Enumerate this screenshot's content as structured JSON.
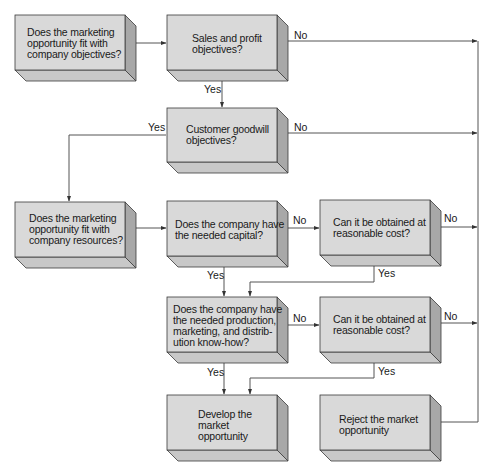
{
  "diagram": {
    "type": "flowchart",
    "colors": {
      "front": "#d9d9d9",
      "bottom": "#c8c8c8",
      "side": "#a8a8a8",
      "edge": "#3a3a3a",
      "line": "#555555"
    },
    "boxes": [
      {
        "id": "fit-objectives",
        "lines": [
          "Does the marketing",
          "opportunity fit with",
          "company objectives?"
        ]
      },
      {
        "id": "sales-profit",
        "lines": [
          "Sales and profit",
          "objectives?"
        ]
      },
      {
        "id": "customer-goodwill",
        "lines": [
          "Customer goodwill",
          "objectives?"
        ]
      },
      {
        "id": "fit-resources",
        "lines": [
          "Does the marketing",
          "opportunity fit with",
          "company resources?"
        ]
      },
      {
        "id": "needed-capital",
        "lines": [
          "Does the company have",
          "the needed capital?"
        ]
      },
      {
        "id": "obtain-capital",
        "lines": [
          "Can it be obtained at",
          "reasonable cost?"
        ]
      },
      {
        "id": "needed-knowhow",
        "lines": [
          "Does the company have",
          "the needed production,",
          "marketing, and distrib-",
          "ution know-how?"
        ]
      },
      {
        "id": "obtain-knowhow",
        "lines": [
          "Can it be obtained at",
          "reasonable cost?"
        ]
      },
      {
        "id": "develop",
        "lines": [
          "Develop the",
          "market",
          "opportunity"
        ]
      },
      {
        "id": "reject",
        "lines": [
          "Reject the market",
          "opportunity"
        ]
      }
    ],
    "labels": {
      "sales_no": "No",
      "sales_yes": "Yes",
      "goodwill_yes": "Yes",
      "goodwill_no": "No",
      "capital_no": "No",
      "capital_yes": "Yes",
      "obtain_capital_no": "No",
      "obtain_capital_yes": "Yes",
      "knowhow_no": "No",
      "knowhow_yes": "Yes",
      "obtain_knowhow_no": "No",
      "obtain_knowhow_yes": "Yes"
    }
  }
}
